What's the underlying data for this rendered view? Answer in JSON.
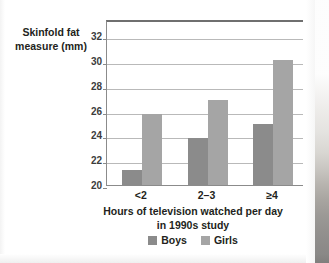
{
  "chart_data": {
    "type": "bar",
    "title": "",
    "categories": [
      "<2",
      "2–3",
      "≥4"
    ],
    "series": [
      {
        "name": "Boys",
        "color": "#8b8b8b",
        "values": [
          21.2,
          23.8,
          24.9
        ]
      },
      {
        "name": "Girls",
        "color": "#a5a5a5",
        "values": [
          25.7,
          26.9,
          30.1
        ]
      }
    ],
    "ylabel": "Skinfold fat measure (mm)",
    "ylabel_line1": "Skinfold fat",
    "ylabel_line2": "measure (mm)",
    "xlabel": "Hours of television watched per day in 1990s study",
    "xlabel_line1": "Hours of television watched per day",
    "xlabel_line2": "in 1990s study",
    "ylim": [
      20,
      33.4
    ],
    "yticks": [
      20,
      22,
      24,
      26,
      28,
      30,
      32
    ],
    "ytick_labels": [
      "20",
      "22",
      "24",
      "26",
      "28",
      "30",
      "32"
    ],
    "grid": "horizontal",
    "legend_position": "bottom-center",
    "legend_entries": [
      "Boys",
      "Girls"
    ]
  },
  "colors": {
    "boys": "#8b8b8b",
    "girls": "#a5a5a5",
    "gridline": "#b9b9b9",
    "axis": "#8b8b8b",
    "frame_top": "#6f6f6f",
    "text": "#231f20",
    "tick_text": "#3c3c3c",
    "background": "#ffffff"
  }
}
